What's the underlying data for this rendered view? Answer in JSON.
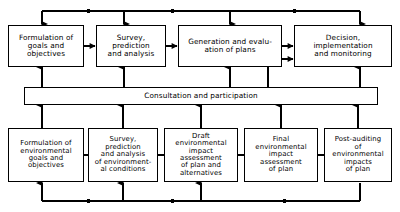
{
  "diagram": {
    "line_color": "#000000",
    "box_fill": "#ffffff",
    "top_row": {
      "label": "planning-process-row",
      "nodes": [
        {
          "name": "formulation-of-goals-and-objectives",
          "text": "Formulation of\ngoals and\nobjectives",
          "x": 8,
          "y": 25,
          "w": 76,
          "h": 42
        },
        {
          "name": "survey-prediction-and-analysis",
          "text": "Survey,\nprediction\nand analysis",
          "x": 96,
          "y": 25,
          "w": 70,
          "h": 42
        },
        {
          "name": "generation-and-evaluation-of-plans",
          "text": "Generation and evalu-\nation of plans",
          "x": 178,
          "y": 25,
          "w": 104,
          "h": 42
        },
        {
          "name": "decision-implementation-and-monitoring",
          "text": "Decision,\nimplementation\nand monitoring",
          "x": 294,
          "y": 25,
          "w": 98,
          "h": 42
        }
      ]
    },
    "middle_bar": {
      "name": "consultation-and-participation-bar",
      "text": "Consultation and participation",
      "x": 24,
      "y": 87,
      "w": 354,
      "h": 18
    },
    "bottom_row": {
      "label": "environmental-assessment-row",
      "nodes": [
        {
          "name": "formulation-of-environmental-goals-and-objectives",
          "text": "Formulation of\nenvironmental\ngoals and\nobjectives",
          "x": 8,
          "y": 128,
          "w": 76,
          "h": 54
        },
        {
          "name": "survey-prediction-and-analysis-of-environmental-conditions",
          "text": "Survey,\nprediction\nand analysis\nof environment-\nal conditions",
          "x": 88,
          "y": 128,
          "w": 70,
          "h": 54
        },
        {
          "name": "draft-environmental-impact-assessment-of-plan-and-alternatives",
          "text": "Draft\nenvironmental\nimpact\nassessment\nof plan and\nalternatives",
          "x": 164,
          "y": 128,
          "w": 74,
          "h": 54
        },
        {
          "name": "final-environmental-impact-assessment-of-plan",
          "text": "Final\nenvironmental\nimpact\nassessment\nof plan",
          "x": 244,
          "y": 128,
          "w": 74,
          "h": 54
        },
        {
          "name": "post-auditing-of-environmental-impacts-of-plan",
          "text": "Post-auditing\nof\nenvironmental\nimpacts\nof plan",
          "x": 324,
          "y": 128,
          "w": 68,
          "h": 54
        }
      ]
    },
    "connectors": {
      "top_feedback_line": {
        "name": "top-feedback-line",
        "y": 11,
        "x_start": 42,
        "x_end": 360,
        "direction": "leftward"
      },
      "bottom_feedback_line": {
        "name": "bottom-feedback-line",
        "y": 201,
        "x_start": 42,
        "x_end": 360,
        "direction": "leftward"
      },
      "top_row_arrows": "rightward",
      "bottom_row_links": "plain"
    }
  }
}
